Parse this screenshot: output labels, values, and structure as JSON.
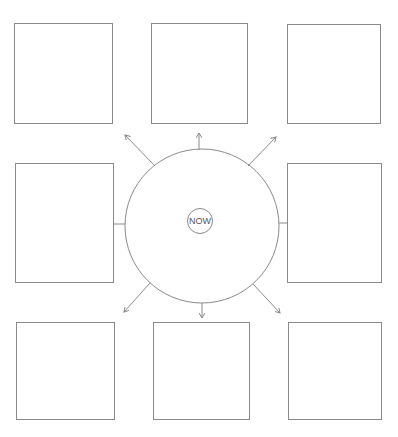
{
  "diagram": {
    "center_label": "NOW",
    "stroke_color": "#8a8a8a",
    "text_color": "#555555",
    "boxes": [
      {
        "id": "top-left",
        "label": "",
        "x": 14,
        "y": 23,
        "w": 99,
        "h": 101
      },
      {
        "id": "top-middle",
        "label": "",
        "x": 151,
        "y": 23,
        "w": 97,
        "h": 101
      },
      {
        "id": "top-right",
        "label": "",
        "x": 287,
        "y": 24,
        "w": 94,
        "h": 100
      },
      {
        "id": "middle-left",
        "label": "",
        "x": 15,
        "y": 163,
        "w": 99,
        "h": 120
      },
      {
        "id": "middle-right",
        "label": "",
        "x": 287,
        "y": 163,
        "w": 95,
        "h": 120
      },
      {
        "id": "bottom-left",
        "label": "",
        "x": 16,
        "y": 322,
        "w": 99,
        "h": 98
      },
      {
        "id": "bottom-middle",
        "label": "",
        "x": 153,
        "y": 322,
        "w": 97,
        "h": 98
      },
      {
        "id": "bottom-right",
        "label": "",
        "x": 288,
        "y": 322,
        "w": 94,
        "h": 98
      }
    ],
    "center_circle": {
      "cx": 202,
      "cy": 226,
      "r": 77
    },
    "connectors": [
      {
        "direction": "north",
        "arrow": true
      },
      {
        "direction": "north-east",
        "arrow": true
      },
      {
        "direction": "east",
        "arrow": false
      },
      {
        "direction": "south-east",
        "arrow": true
      },
      {
        "direction": "south",
        "arrow": true
      },
      {
        "direction": "south-west",
        "arrow": true
      },
      {
        "direction": "west",
        "arrow": false
      },
      {
        "direction": "north-west",
        "arrow": true
      }
    ]
  }
}
